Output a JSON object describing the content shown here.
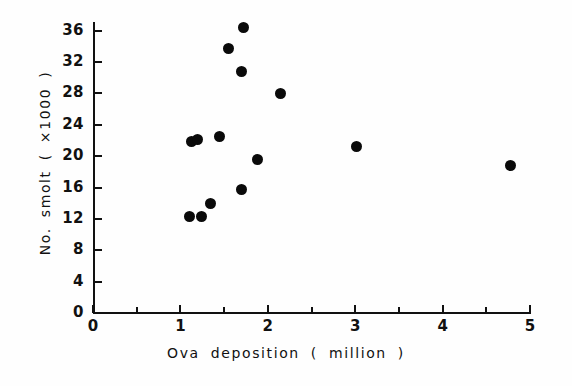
{
  "chart_data": {
    "type": "scatter",
    "title": "",
    "xlabel": "Ova  deposition  ( million )",
    "ylabel": "No. smolt ( ×1000 )",
    "xlim": [
      0,
      5
    ],
    "ylim": [
      0,
      38
    ],
    "xticks": [
      0,
      1,
      2,
      3,
      4,
      5
    ],
    "xtick_labels": [
      "0",
      "1",
      "2",
      "3",
      "4",
      "5"
    ],
    "xminor_ticks": [
      0.5,
      1.5,
      2.5,
      3.5,
      4.5
    ],
    "yticks": [
      0,
      4,
      8,
      12,
      16,
      20,
      24,
      28,
      32,
      36
    ],
    "ytick_labels": [
      "0",
      "4",
      "8",
      "12",
      "16",
      "20",
      "24",
      "28",
      "32",
      "36"
    ],
    "grid": false,
    "legend": false,
    "marker": "filled-circle",
    "marker_color": "#0a0a0a",
    "points": [
      {
        "x": 1.1,
        "y": 12.3
      },
      {
        "x": 1.24,
        "y": 12.3
      },
      {
        "x": 1.34,
        "y": 13.9
      },
      {
        "x": 1.7,
        "y": 15.8
      },
      {
        "x": 1.88,
        "y": 19.6
      },
      {
        "x": 1.13,
        "y": 21.9
      },
      {
        "x": 1.2,
        "y": 22.1
      },
      {
        "x": 1.45,
        "y": 22.5
      },
      {
        "x": 3.02,
        "y": 21.2
      },
      {
        "x": 4.78,
        "y": 18.8
      },
      {
        "x": 2.14,
        "y": 28.0
      },
      {
        "x": 1.7,
        "y": 30.8
      },
      {
        "x": 1.55,
        "y": 33.7
      },
      {
        "x": 1.72,
        "y": 36.4
      }
    ]
  },
  "axes": {
    "x_title": "Ova  deposition  ( million )",
    "y_title": "No. smolt ( ×1000 )"
  }
}
